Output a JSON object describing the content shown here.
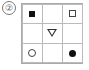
{
  "label": "②",
  "grid": {
    "rows": 3,
    "cols": 3,
    "cells": [
      {
        "row": 0,
        "col": 0,
        "symbol": "filled-square"
      },
      {
        "row": 0,
        "col": 1,
        "symbol": "empty"
      },
      {
        "row": 0,
        "col": 2,
        "symbol": "empty-square"
      },
      {
        "row": 1,
        "col": 0,
        "symbol": "empty"
      },
      {
        "row": 1,
        "col": 1,
        "symbol": "down-triangle"
      },
      {
        "row": 1,
        "col": 2,
        "symbol": "empty"
      },
      {
        "row": 2,
        "col": 0,
        "symbol": "empty-circle"
      },
      {
        "row": 2,
        "col": 1,
        "symbol": "empty"
      },
      {
        "row": 2,
        "col": 2,
        "symbol": "filled-circle"
      }
    ]
  }
}
